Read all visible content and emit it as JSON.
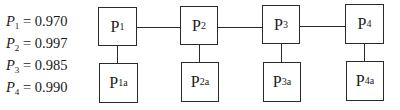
{
  "legend": [
    {
      "symbol": "P",
      "sub": "1",
      "eq": " = ",
      "value": "0.970"
    },
    {
      "symbol": "P",
      "sub": "2",
      "eq": " = ",
      "value": "0.997"
    },
    {
      "symbol": "P",
      "sub": "3",
      "eq": " = ",
      "value": "0.985"
    },
    {
      "symbol": "P",
      "sub": "4",
      "eq": " = ",
      "value": "0.990"
    }
  ],
  "main_components": [
    {
      "base": "P",
      "sub": "1"
    },
    {
      "base": "P",
      "sub": "2"
    },
    {
      "base": "P",
      "sub": "3"
    },
    {
      "base": "P",
      "sub": "4"
    }
  ],
  "backup_components": [
    {
      "base": "P",
      "sub": "1a"
    },
    {
      "base": "P",
      "sub": "2a"
    },
    {
      "base": "P",
      "sub": "3a"
    },
    {
      "base": "P",
      "sub": "4a"
    }
  ]
}
